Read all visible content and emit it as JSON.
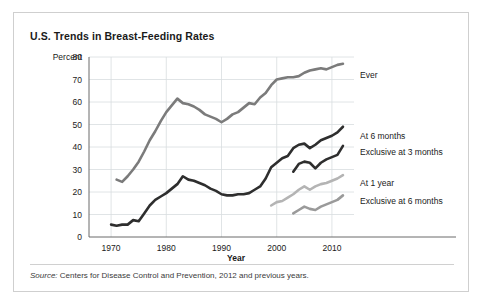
{
  "figure": {
    "title": "U.S. Trends in Breast-Feeding Rates",
    "source_lead": "Source:",
    "source_rest": " Centers for Disease Control and Prevention, 2012 and previous years."
  },
  "chart_data": {
    "type": "line",
    "title": "U.S. Trends in Breast-Feeding Rates",
    "xlabel": "Year",
    "ylabel": "Percent",
    "xlim": [
      1966,
      2014
    ],
    "ylim": [
      0,
      80
    ],
    "xticks": [
      1970,
      1980,
      1990,
      2000,
      2010
    ],
    "yticks": [
      0,
      10,
      20,
      30,
      40,
      50,
      60,
      70,
      80
    ],
    "grid": true,
    "legend_position": "right-inline",
    "colors": {
      "ever": "#7b7b7b",
      "at_6_months": "#2e2e2e",
      "exclusive_at_3_months": "#2e2e2e",
      "at_1_year": "#b4b4b4",
      "exclusive_at_6_months": "#9a9a9a"
    },
    "series": [
      {
        "name": "Ever",
        "label": "Ever",
        "color": "#7b7b7b",
        "label_y": 72,
        "x": [
          1971,
          1972,
          1973,
          1974,
          1975,
          1976,
          1977,
          1978,
          1979,
          1980,
          1981,
          1982,
          1983,
          1984,
          1985,
          1986,
          1987,
          1988,
          1989,
          1990,
          1991,
          1992,
          1993,
          1994,
          1995,
          1996,
          1997,
          1998,
          1999,
          2000,
          2001,
          2002,
          2003,
          2004,
          2005,
          2006,
          2007,
          2008,
          2009,
          2010,
          2011,
          2012
        ],
        "values": [
          25.5,
          24.5,
          27,
          30,
          33.5,
          38,
          43,
          47,
          51.5,
          55.5,
          58.5,
          61.5,
          59.5,
          59,
          58,
          56.5,
          54.5,
          53.5,
          52.5,
          51,
          52.5,
          54.5,
          55.5,
          57.5,
          59.5,
          59,
          62,
          64,
          67.5,
          70,
          70.5,
          71,
          71,
          71.5,
          73,
          74,
          74.5,
          75,
          74.5,
          75.5,
          76.5,
          77
        ]
      },
      {
        "name": "At 6 months",
        "label": "At 6 months",
        "color": "#2e2e2e",
        "label_y": 45,
        "x": [
          1970,
          1971,
          1972,
          1973,
          1974,
          1975,
          1976,
          1977,
          1978,
          1979,
          1980,
          1981,
          1982,
          1983,
          1984,
          1985,
          1986,
          1987,
          1988,
          1989,
          1990,
          1991,
          1992,
          1993,
          1994,
          1995,
          1996,
          1997,
          1998,
          1999,
          2000,
          2001,
          2002,
          2003,
          2004,
          2005,
          2006,
          2007,
          2008,
          2009,
          2010,
          2011,
          2012
        ],
        "values": [
          5.5,
          5,
          5.5,
          5.5,
          7.5,
          7,
          10.5,
          14,
          16.5,
          18,
          19.5,
          21.5,
          23.5,
          27,
          25.5,
          25,
          24,
          23,
          21.5,
          20.5,
          19,
          18.5,
          18.5,
          19,
          19,
          19.5,
          21,
          22.5,
          26,
          31,
          33,
          35,
          36,
          39.5,
          41,
          41.5,
          39.5,
          41,
          43,
          44,
          45,
          46.5,
          49
        ]
      },
      {
        "name": "Exclusive at 3 months",
        "label": "Exclusive at 3 months",
        "color": "#2e2e2e",
        "label_y": 38,
        "x": [
          2003,
          2004,
          2005,
          2006,
          2007,
          2008,
          2009,
          2010,
          2011,
          2012
        ],
        "values": [
          29,
          32.5,
          33.5,
          33,
          30.5,
          33,
          34.5,
          35.5,
          36.5,
          40.5
        ]
      },
      {
        "name": "At 1 year",
        "label": "At 1 year",
        "color": "#b4b4b4",
        "label_y": 24,
        "x": [
          1999,
          2000,
          2001,
          2002,
          2003,
          2004,
          2005,
          2006,
          2007,
          2008,
          2009,
          2010,
          2011,
          2012
        ],
        "values": [
          14,
          15.5,
          16,
          17.5,
          19,
          21,
          22.5,
          21,
          22.5,
          23.5,
          24,
          25,
          26,
          27.5
        ]
      },
      {
        "name": "Exclusive at 6 months",
        "label": "Exclusive at 6 months",
        "color": "#9a9a9a",
        "label_y": 16,
        "x": [
          2003,
          2004,
          2005,
          2006,
          2007,
          2008,
          2009,
          2010,
          2011,
          2012
        ],
        "values": [
          10.5,
          12,
          13.5,
          12.5,
          12,
          13.5,
          14.5,
          15.5,
          16.5,
          18.5
        ]
      }
    ]
  }
}
